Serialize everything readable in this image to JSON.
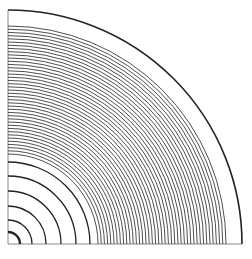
{
  "diagram": {
    "type": "quarter-circle-concentric-arcs",
    "origin": {
      "x": 8,
      "y": 244
    },
    "outer_radius": 234,
    "inner_radii": [
      12,
      24,
      38,
      53,
      68,
      82
    ],
    "dense_band": {
      "start_radius": 90,
      "end_radius": 218,
      "count": 41
    },
    "colors": {
      "stroke": "#222222",
      "background": "#ffffff"
    }
  }
}
